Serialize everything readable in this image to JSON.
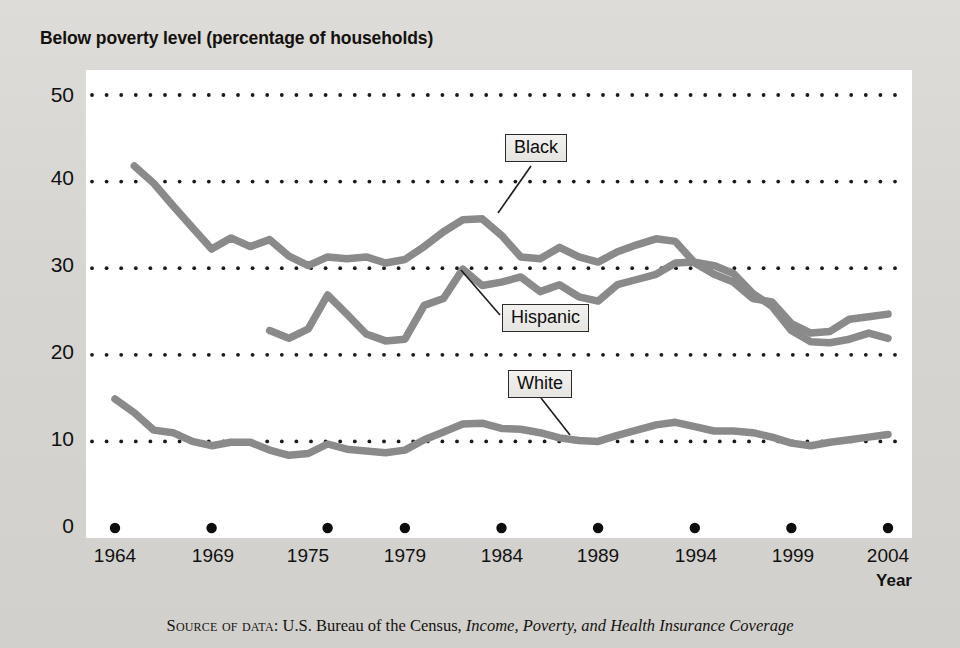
{
  "chart_title": "Below poverty level (percentage of households)",
  "axes": {
    "ylabel": "",
    "xlabel": "Year",
    "ylim": [
      0,
      50
    ],
    "xlim": [
      1963,
      2005
    ],
    "ytick_labels": [
      "50",
      "40",
      "30",
      "20",
      "10",
      "0"
    ],
    "yticks": [
      50,
      40,
      30,
      20,
      10,
      0
    ],
    "xtick_labels": [
      "1964",
      "1969",
      "1975",
      "1979",
      "1984",
      "1989",
      "1994",
      "1999",
      "2004"
    ],
    "xticks": [
      1964,
      1969,
      1975,
      1979,
      1984,
      1989,
      1994,
      1999,
      2004
    ],
    "grid": "horizontal dotted"
  },
  "series_labels": {
    "black": "Black",
    "hispanic": "Hispanic",
    "white": "White"
  },
  "source": {
    "prefix": "Source of data",
    "separator": ": ",
    "agency": "U.S. Bureau of the Census, ",
    "publication": "Income, Poverty, and Health Insurance Coverage"
  },
  "colors": {
    "line": "#8a8a8a",
    "plot_background": "#ffffff",
    "page_background": "#d9d9d6",
    "text": "#111111",
    "grid_dot": "#1a1a1a"
  },
  "chart_data": {
    "type": "line",
    "title": "Below poverty level (percentage of households)",
    "xlabel": "Year",
    "ylabel": "Percentage of households below poverty level",
    "xlim": [
      1963,
      2005
    ],
    "ylim": [
      0,
      50
    ],
    "grid": true,
    "legend": "inline annotated labels",
    "series": [
      {
        "name": "Black",
        "x": [
          1965,
          1966,
          1967,
          1968,
          1969,
          1970,
          1971,
          1972,
          1973,
          1974,
          1975,
          1976,
          1977,
          1978,
          1979,
          1980,
          1981,
          1982,
          1983,
          1984,
          1985,
          1986,
          1987,
          1988,
          1989,
          1990,
          1991,
          1992,
          1993,
          1994,
          1995,
          1996,
          1997,
          1998,
          1999,
          2000,
          2001,
          2002,
          2003,
          2004
        ],
        "values": [
          41.8,
          39.8,
          37.2,
          34.7,
          32.2,
          33.5,
          32.5,
          33.3,
          31.4,
          30.3,
          31.3,
          31.1,
          31.3,
          30.6,
          31.0,
          32.5,
          34.2,
          35.6,
          35.7,
          33.8,
          31.3,
          31.1,
          32.4,
          31.3,
          30.7,
          31.9,
          32.7,
          33.4,
          33.1,
          30.6,
          29.3,
          28.4,
          26.5,
          26.1,
          23.6,
          22.5,
          22.7,
          24.1,
          24.4,
          24.7
        ],
        "note": "Starts 1965; highest series"
      },
      {
        "name": "Hispanic",
        "x": [
          1972,
          1973,
          1974,
          1975,
          1976,
          1977,
          1978,
          1979,
          1980,
          1981,
          1982,
          1983,
          1984,
          1985,
          1986,
          1987,
          1988,
          1989,
          1990,
          1991,
          1992,
          1993,
          1994,
          1995,
          1996,
          1997,
          1998,
          1999,
          2000,
          2001,
          2002,
          2003,
          2004
        ],
        "values": [
          22.8,
          21.9,
          23.0,
          26.9,
          24.7,
          22.4,
          21.6,
          21.8,
          25.7,
          26.5,
          29.9,
          28.0,
          28.4,
          29.0,
          27.3,
          28.1,
          26.7,
          26.2,
          28.1,
          28.7,
          29.3,
          30.6,
          30.7,
          30.3,
          29.4,
          27.1,
          25.6,
          22.8,
          21.5,
          21.4,
          21.8,
          22.5,
          21.9
        ],
        "note": "Starts 1972; crosses Black series after 1994"
      },
      {
        "name": "White",
        "x": [
          1964,
          1965,
          1966,
          1967,
          1968,
          1969,
          1970,
          1971,
          1972,
          1973,
          1974,
          1975,
          1976,
          1977,
          1978,
          1979,
          1980,
          1981,
          1982,
          1983,
          1984,
          1985,
          1986,
          1987,
          1988,
          1989,
          1990,
          1991,
          1992,
          1993,
          1994,
          1995,
          1996,
          1997,
          1998,
          1999,
          2000,
          2001,
          2002,
          2003,
          2004
        ],
        "values": [
          14.9,
          13.3,
          11.3,
          11.0,
          10.0,
          9.5,
          9.9,
          9.9,
          9.0,
          8.4,
          8.6,
          9.7,
          9.1,
          8.9,
          8.7,
          9.0,
          10.2,
          11.1,
          12.0,
          12.1,
          11.5,
          11.4,
          11.0,
          10.4,
          10.1,
          10.0,
          10.7,
          11.3,
          11.9,
          12.2,
          11.7,
          11.2,
          11.2,
          11.0,
          10.5,
          9.8,
          9.5,
          9.9,
          10.2,
          10.5,
          10.8
        ],
        "note": "Lowest series; starts 1964"
      }
    ]
  }
}
